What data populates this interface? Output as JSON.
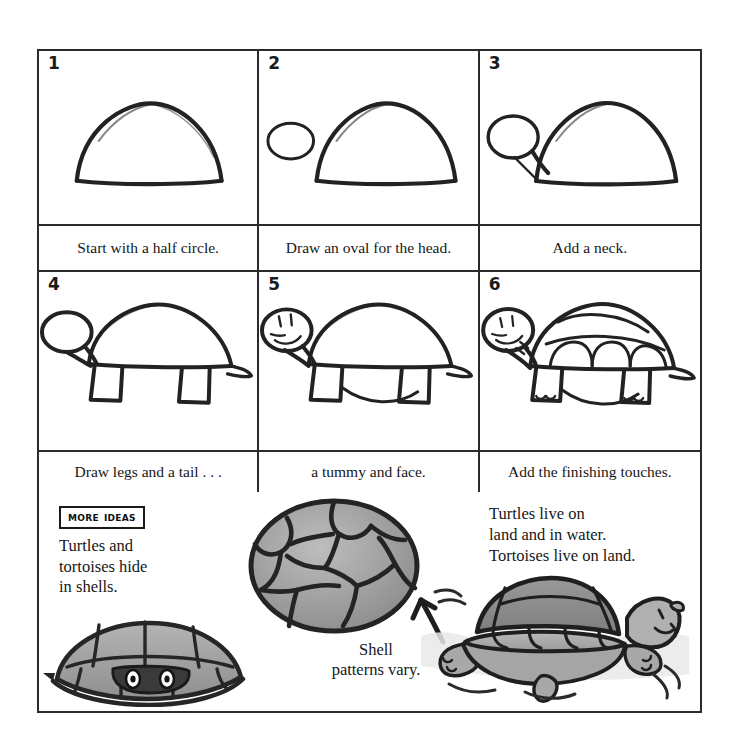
{
  "page": {
    "background": "#ffffff",
    "ink_color": "#2b2b2b",
    "shade_color": "#9a9a9a",
    "shade_light": "#c4c4c4"
  },
  "steps": [
    {
      "number": "1",
      "caption": "Start with a half circle.",
      "art": "half-circle"
    },
    {
      "number": "2",
      "caption": "Draw an oval for the head.",
      "art": "half-circle-with-oval"
    },
    {
      "number": "3",
      "caption": "Add a neck.",
      "art": "half-circle-with-neck"
    },
    {
      "number": "4",
      "caption": "Draw legs and a tail . . .",
      "art": "turtle-with-legs"
    },
    {
      "number": "5",
      "caption": "a tummy and face.",
      "art": "turtle-with-face"
    },
    {
      "number": "6",
      "caption": "Add the finishing touches.",
      "art": "turtle-finished"
    }
  ],
  "ideas": {
    "badge_label": "More Ideas",
    "hide_text": "Turtles and\ntortoises hide\nin shells.",
    "live_text": "Turtles live on\nland and in water.\nTortoises live on land.",
    "shell_text": "Shell\npatterns vary.",
    "art_hiding": "turtle-hiding-in-shell",
    "art_shell": "shell-top-view",
    "art_swimming": "turtle-in-water",
    "arrow": "arrow-up-left"
  }
}
